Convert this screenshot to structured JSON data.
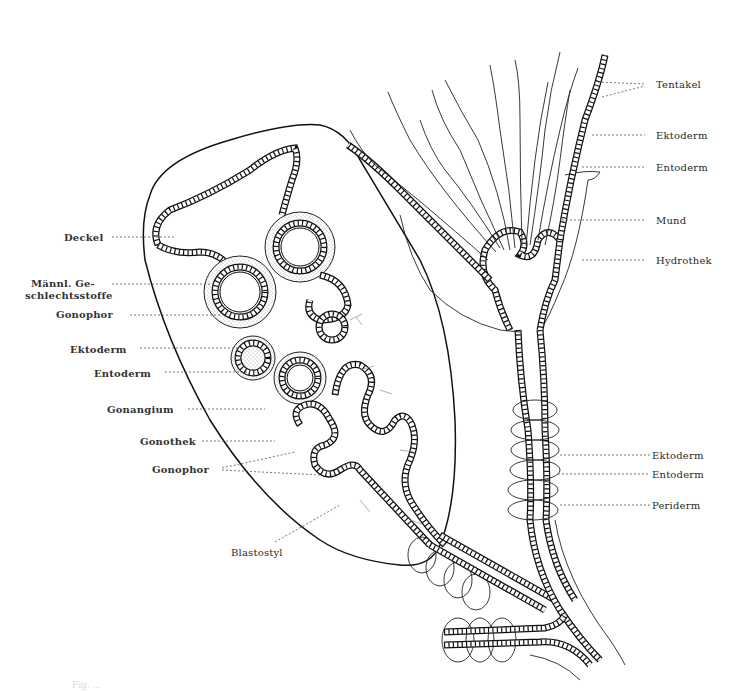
{
  "figure": {
    "caption_fragment": "Fig. ...",
    "colors": {
      "ink": "#111111",
      "paper": "#ffffff",
      "label": "#2a2a2a",
      "leader": "#555555"
    }
  },
  "labels_left": [
    {
      "id": "deckel",
      "text": "Deckel"
    },
    {
      "id": "maennl",
      "text": "Männl. Ge-"
    },
    {
      "id": "maennl2",
      "text": "schlechtsstoffe"
    },
    {
      "id": "gonophor1",
      "text": "Gonophor"
    },
    {
      "id": "ektoderm_l",
      "text": "Ektoderm"
    },
    {
      "id": "entoderm_l",
      "text": "Entoderm"
    },
    {
      "id": "gonangium",
      "text": "Gonangium"
    },
    {
      "id": "gonothek",
      "text": "Gonothek"
    },
    {
      "id": "gonophor2",
      "text": "Gonophor"
    },
    {
      "id": "blastostyl",
      "text": "Blastostyl"
    }
  ],
  "labels_right": [
    {
      "id": "tentakel",
      "text": "Tentakel"
    },
    {
      "id": "ektoderm_r1",
      "text": "Ektoderm"
    },
    {
      "id": "entoderm_r1",
      "text": "Entoderm"
    },
    {
      "id": "mund",
      "text": "Mund"
    },
    {
      "id": "hydrothek",
      "text": "Hydrothek"
    },
    {
      "id": "ektoderm_r2",
      "text": "Ektoderm"
    },
    {
      "id": "entoderm_r2",
      "text": "Entoderm"
    },
    {
      "id": "periderm",
      "text": "Periderm"
    }
  ]
}
